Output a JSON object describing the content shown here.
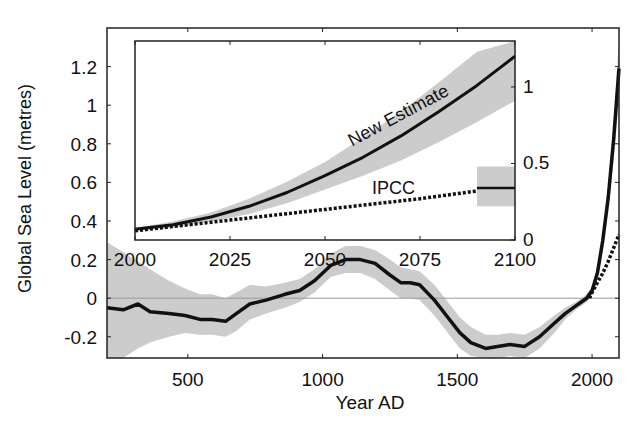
{
  "chart_data": [
    {
      "id": "main",
      "type": "line",
      "title": "",
      "xlabel": "Year AD",
      "ylabel": "Global Sea Level (metres)",
      "xlim": [
        200,
        2100
      ],
      "ylim": [
        -0.31,
        1.4
      ],
      "xticks": [
        500,
        1000,
        1500,
        2000
      ],
      "yticks": [
        -0.2,
        0,
        0.2,
        0.4,
        0.6,
        0.8,
        1,
        1.2
      ],
      "ytick_labels": [
        "-0.2",
        "0",
        "0.2",
        "0.4",
        "0.6",
        "0.8",
        "1",
        "1.2"
      ],
      "zero_line": true,
      "series": [
        {
          "name": "Reconstruction",
          "style": "solid",
          "x": [
            200,
            260,
            315,
            360,
            430,
            490,
            545,
            590,
            640,
            680,
            730,
            790,
            860,
            915,
            970,
            1030,
            1085,
            1140,
            1195,
            1250,
            1290,
            1325,
            1360,
            1415,
            1465,
            1510,
            1550,
            1605,
            1650,
            1695,
            1750,
            1805,
            1860,
            1900,
            1940,
            1960,
            1980,
            2000,
            2020,
            2040,
            2060,
            2080,
            2100
          ],
          "values": [
            -0.05,
            -0.06,
            -0.03,
            -0.07,
            -0.08,
            -0.09,
            -0.11,
            -0.11,
            -0.12,
            -0.08,
            -0.03,
            -0.01,
            0.02,
            0.04,
            0.09,
            0.17,
            0.2,
            0.2,
            0.18,
            0.12,
            0.08,
            0.08,
            0.07,
            -0.01,
            -0.1,
            -0.18,
            -0.23,
            -0.26,
            -0.25,
            -0.24,
            -0.25,
            -0.2,
            -0.13,
            -0.08,
            -0.04,
            -0.02,
            0.0,
            0.04,
            0.13,
            0.3,
            0.52,
            0.82,
            1.19
          ],
          "band_upper": [
            0.29,
            0.24,
            0.19,
            0.15,
            0.09,
            0.05,
            0.02,
            0.02,
            0.0,
            0.03,
            0.07,
            0.06,
            0.08,
            0.1,
            0.15,
            0.23,
            0.27,
            0.27,
            0.25,
            0.2,
            0.16,
            0.15,
            0.14,
            0.07,
            -0.02,
            -0.1,
            -0.15,
            -0.19,
            -0.19,
            -0.18,
            -0.19,
            -0.15,
            -0.09,
            -0.05,
            -0.02,
            0.0,
            0.02,
            0.06,
            0.16,
            0.34,
            0.58,
            0.92,
            1.35
          ],
          "band_lower": [
            -0.31,
            -0.31,
            -0.26,
            -0.23,
            -0.2,
            -0.18,
            -0.19,
            -0.19,
            -0.2,
            -0.17,
            -0.11,
            -0.08,
            -0.05,
            -0.02,
            0.03,
            0.11,
            0.13,
            0.13,
            0.1,
            0.04,
            0.0,
            0.0,
            -0.01,
            -0.09,
            -0.18,
            -0.26,
            -0.3,
            -0.31,
            -0.31,
            -0.3,
            -0.31,
            -0.26,
            -0.18,
            -0.11,
            -0.06,
            -0.04,
            -0.02,
            0.02,
            0.1,
            0.25,
            0.45,
            0.72,
            1.02
          ]
        },
        {
          "name": "IPCC projection",
          "style": "dashed",
          "x": [
            1990,
            2000,
            2020,
            2040,
            2060,
            2080,
            2100
          ],
          "values": [
            0.0,
            0.03,
            0.08,
            0.13,
            0.19,
            0.26,
            0.33
          ]
        }
      ]
    },
    {
      "id": "inset",
      "type": "line",
      "title": "",
      "xlim": [
        2000,
        2100
      ],
      "ylim": [
        0,
        1.3
      ],
      "xticks": [
        2000,
        2025,
        2050,
        2075,
        2100
      ],
      "yticks": [
        0,
        0.5,
        1
      ],
      "ytick_labels": [
        "0",
        "0.5",
        "1"
      ],
      "yaxis_side": "right",
      "series": [
        {
          "name": "New Estimate",
          "style": "solid",
          "x": [
            2000,
            2010,
            2020,
            2030,
            2040,
            2050,
            2060,
            2070,
            2080,
            2090,
            2100
          ],
          "values": [
            0.07,
            0.1,
            0.15,
            0.22,
            0.31,
            0.42,
            0.54,
            0.68,
            0.84,
            1.01,
            1.2
          ],
          "band_upper": [
            0.08,
            0.12,
            0.18,
            0.27,
            0.38,
            0.51,
            0.67,
            0.84,
            1.03,
            1.23,
            1.43
          ],
          "band_lower": [
            0.06,
            0.08,
            0.12,
            0.17,
            0.24,
            0.33,
            0.42,
            0.52,
            0.64,
            0.77,
            0.91
          ]
        },
        {
          "name": "IPCC",
          "style": "dashed",
          "x": [
            2000,
            2025,
            2050,
            2075,
            2090
          ],
          "values": [
            0.06,
            0.13,
            0.2,
            0.27,
            0.32
          ]
        },
        {
          "name": "IPCC 2090-2100 range",
          "style": "box",
          "x_range": [
            2090,
            2100
          ],
          "central": 0.34,
          "range": [
            0.22,
            0.48
          ]
        }
      ],
      "annotations": [
        {
          "text": "New Estimate",
          "x": 2070,
          "y": 0.78,
          "rotation": -28
        },
        {
          "text": "IPCC",
          "x": 2068,
          "y": 0.3,
          "rotation": 0
        }
      ]
    }
  ],
  "labels": {
    "xlabel": "Year AD",
    "ylabel": "Global Sea Level (metres)",
    "inset_new_estimate": "New Estimate",
    "inset_ipcc": "IPCC"
  },
  "colors": {
    "line": "#111111",
    "band": "#cccccc",
    "zero_line": "#999999",
    "axis": "#222222"
  }
}
